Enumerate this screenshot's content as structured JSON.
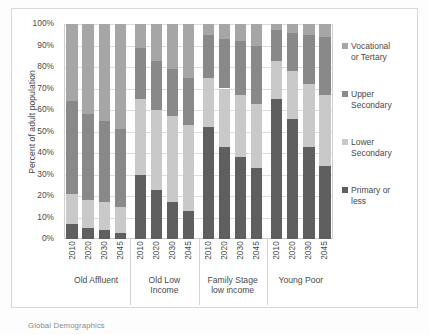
{
  "footer": {
    "source_note": "Global Demographics"
  },
  "axis": {
    "y_title": "Percent of adult population",
    "y_ticks": [
      "100%",
      "90%",
      "80%",
      "70%",
      "60%",
      "50%",
      "40%",
      "30%",
      "20%",
      "10%",
      "0%"
    ]
  },
  "legend": {
    "items": [
      {
        "label": "Vocational\nor Tertary",
        "color": "#a6a6a6",
        "swatch_name": "legend-swatch-vocational"
      },
      {
        "label": "Upper\nSecondary",
        "color": "#898989",
        "swatch_name": "legend-swatch-upper"
      },
      {
        "label": "Lower\nSecondary",
        "color": "#c9c9c9",
        "swatch_name": "legend-swatch-lower"
      },
      {
        "label": "Primary or\nless",
        "color": "#5f5f5f",
        "swatch_name": "legend-swatch-primary"
      }
    ]
  },
  "groups": [
    {
      "label": "Old Affluent",
      "years": [
        "2010",
        "2020",
        "2030",
        "2045"
      ]
    },
    {
      "label": "Old Low\nIncome",
      "years": [
        "2010",
        "2020",
        "2030",
        "2045"
      ]
    },
    {
      "label": "Family Stage\nlow income",
      "years": [
        "2010",
        "2020",
        "2030",
        "2045"
      ]
    },
    {
      "label": "Young Poor",
      "years": [
        "2010",
        "2020",
        "2030",
        "2045"
      ]
    }
  ],
  "chart_data": {
    "type": "bar",
    "stacked": true,
    "stack_total": 100,
    "title": "",
    "xlabel": "",
    "ylabel": "Percent of adult population",
    "ylim": [
      0,
      100
    ],
    "ytick_interval": 10,
    "grid": true,
    "legend_position": "right",
    "categories": [
      "Old Affluent 2010",
      "Old Affluent 2020",
      "Old Affluent 2030",
      "Old Affluent 2045",
      "Old Low Income 2010",
      "Old Low Income 2020",
      "Old Low Income 2030",
      "Old Low Income 2045",
      "Family Stage low income 2010",
      "Family Stage low income 2020",
      "Family Stage low income 2030",
      "Family Stage low income 2045",
      "Young Poor 2010",
      "Young Poor 2020",
      "Young Poor 2030",
      "Young Poor 2045"
    ],
    "series": [
      {
        "name": "Primary or less",
        "color": "#5f5f5f",
        "values": [
          7,
          5,
          4,
          3,
          30,
          23,
          17,
          13,
          52,
          43,
          38,
          33,
          65,
          56,
          43,
          34
        ]
      },
      {
        "name": "Lower Secondary",
        "color": "#c9c9c9",
        "values": [
          14,
          13,
          13,
          12,
          35,
          37,
          40,
          40,
          23,
          27,
          29,
          30,
          18,
          22,
          29,
          33
        ]
      },
      {
        "name": "Upper Secondary",
        "color": "#898989",
        "values": [
          43,
          40,
          38,
          36,
          24,
          23,
          22,
          22,
          20,
          23,
          25,
          27,
          14,
          18,
          23,
          27
        ]
      },
      {
        "name": "Vocational or Tertary",
        "color": "#a6a6a6",
        "values": [
          36,
          42,
          45,
          49,
          11,
          17,
          21,
          25,
          5,
          7,
          8,
          10,
          3,
          4,
          5,
          6
        ]
      }
    ],
    "cumulative_tops": {
      "note": "running top edge of each stack, percent",
      "primary_or_less": [
        7,
        5,
        4,
        3,
        30,
        23,
        17,
        13,
        52,
        43,
        38,
        33,
        65,
        56,
        43,
        34
      ],
      "lower_secondary": [
        21,
        18,
        17,
        15,
        65,
        60,
        57,
        53,
        75,
        70,
        67,
        63,
        83,
        78,
        72,
        67
      ],
      "upper_secondary": [
        64,
        58,
        55,
        51,
        89,
        83,
        79,
        75,
        95,
        93,
        92,
        90,
        97,
        96,
        95,
        94
      ],
      "vocational_or_tertary": [
        100,
        100,
        100,
        100,
        100,
        100,
        100,
        100,
        100,
        100,
        100,
        100,
        100,
        100,
        100,
        100
      ]
    }
  }
}
